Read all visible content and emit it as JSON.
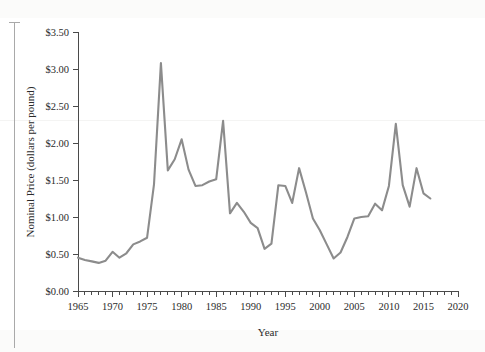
{
  "figure": {
    "background_color": "#ffffff",
    "line_color": "#8c8c8c",
    "axis_color": "#4a4a4a",
    "margin_rule_color": "#a9a9a9"
  },
  "chart_data": {
    "type": "line",
    "title": "",
    "xlabel": "Year",
    "ylabel": "Nominal Price (dollars per pound)",
    "xlim": [
      1965,
      2020
    ],
    "ylim": [
      0.0,
      3.5
    ],
    "xtick_labels": [
      "1965",
      "1970",
      "1975",
      "1980",
      "1985",
      "1990",
      "1995",
      "2000",
      "2005",
      "2010",
      "2015",
      "2020"
    ],
    "xtick_values": [
      1965,
      1970,
      1975,
      1980,
      1985,
      1990,
      1995,
      2000,
      2005,
      2010,
      2015,
      2020
    ],
    "xtick_minor_step": 1,
    "ytick_labels": [
      "$0.00",
      "$0.50",
      "$1.00",
      "$1.50",
      "$2.00",
      "$2.50",
      "$3.00",
      "$3.50"
    ],
    "ytick_values": [
      0.0,
      0.5,
      1.0,
      1.5,
      2.0,
      2.5,
      3.0,
      3.5
    ],
    "grid": false,
    "legend": false,
    "legend_position": "none",
    "x": [
      1965,
      1966,
      1967,
      1968,
      1969,
      1970,
      1971,
      1972,
      1973,
      1974,
      1975,
      1976,
      1977,
      1978,
      1979,
      1980,
      1981,
      1982,
      1983,
      1984,
      1985,
      1986,
      1987,
      1988,
      1989,
      1990,
      1991,
      1992,
      1993,
      1994,
      1995,
      1996,
      1997,
      1998,
      1999,
      2000,
      2001,
      2002,
      2003,
      2004,
      2005,
      2006,
      2007,
      2008,
      2009,
      2010,
      2011,
      2012,
      2013,
      2014,
      2015,
      2016
    ],
    "values": [
      0.45,
      0.42,
      0.4,
      0.38,
      0.41,
      0.53,
      0.45,
      0.51,
      0.63,
      0.67,
      0.72,
      1.44,
      3.08,
      1.63,
      1.78,
      2.05,
      1.64,
      1.42,
      1.43,
      1.48,
      1.51,
      2.3,
      1.05,
      1.19,
      1.07,
      0.92,
      0.85,
      0.57,
      0.64,
      1.43,
      1.42,
      1.19,
      1.66,
      1.33,
      0.98,
      0.82,
      0.63,
      0.44,
      0.52,
      0.73,
      0.98,
      1.0,
      1.01,
      1.18,
      1.09,
      1.42,
      2.26,
      1.43,
      1.14,
      1.66,
      1.32,
      1.25
    ],
    "series": [
      {
        "name": "Nominal Price",
        "color": "#8c8c8c",
        "values": [
          0.45,
          0.42,
          0.4,
          0.38,
          0.41,
          0.53,
          0.45,
          0.51,
          0.63,
          0.67,
          0.72,
          1.44,
          3.08,
          1.63,
          1.78,
          2.05,
          1.64,
          1.42,
          1.43,
          1.48,
          1.51,
          2.3,
          1.05,
          1.19,
          1.07,
          0.92,
          0.85,
          0.57,
          0.64,
          1.43,
          1.42,
          1.19,
          1.66,
          1.33,
          0.98,
          0.82,
          0.63,
          0.44,
          0.52,
          0.73,
          0.98,
          1.0,
          1.01,
          1.18,
          1.09,
          1.42,
          2.26,
          1.43,
          1.14,
          1.66,
          1.32,
          1.25
        ]
      }
    ],
    "annotations": []
  }
}
